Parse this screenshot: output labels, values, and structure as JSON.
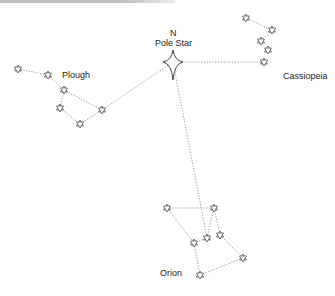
{
  "diagram": {
    "title_cut": "",
    "labels": {
      "north": "N",
      "pole_star": "Pole Star",
      "plough": "Plough",
      "cassiopeia": "Cassiopeia",
      "orion": "Orion"
    },
    "colors": {
      "star_stroke": "#555555",
      "line": "#8a8a8a",
      "text": "#222222"
    },
    "pole_star": {
      "x": 173,
      "y": 62
    },
    "constellations": [
      {
        "name": "Plough",
        "stars": [
          [
            18,
            69
          ],
          [
            48,
            75
          ],
          [
            64,
            90
          ],
          [
            60,
            108
          ],
          [
            80,
            124
          ],
          [
            102,
            110
          ]
        ],
        "lines": [
          [
            0,
            1
          ],
          [
            1,
            2
          ],
          [
            2,
            3
          ],
          [
            3,
            4
          ],
          [
            4,
            5
          ],
          [
            5,
            2
          ]
        ],
        "to_pole": 5
      },
      {
        "name": "Cassiopeia",
        "stars": [
          [
            246,
            18
          ],
          [
            272,
            30
          ],
          [
            261,
            41
          ],
          [
            268,
            50
          ],
          [
            264,
            62
          ]
        ],
        "lines": [
          [
            0,
            1
          ],
          [
            1,
            2
          ]
        ],
        "to_pole": 4
      },
      {
        "name": "Orion",
        "stars": [
          [
            167,
            208
          ],
          [
            214,
            208
          ],
          [
            207,
            238
          ],
          [
            194,
            243
          ],
          [
            220,
            235
          ],
          [
            243,
            258
          ],
          [
            200,
            275
          ]
        ],
        "lines": [
          [
            0,
            1
          ],
          [
            1,
            4
          ],
          [
            4,
            5
          ],
          [
            5,
            6
          ],
          [
            6,
            3
          ],
          [
            3,
            2
          ],
          [
            2,
            1
          ],
          [
            0,
            3
          ]
        ],
        "to_pole": 2
      }
    ]
  }
}
